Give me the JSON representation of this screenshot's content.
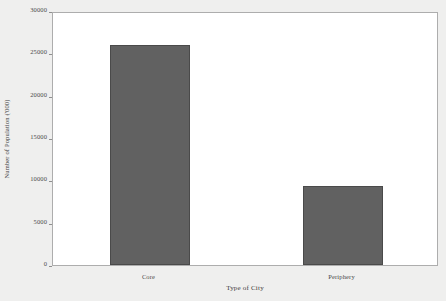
{
  "chart_data": {
    "type": "bar",
    "title": "",
    "categories": [
      "Core",
      "Periphery"
    ],
    "values": [
      26000,
      9300
    ],
    "xlabel": "Type of City",
    "ylabel": "Number of Population ('000)",
    "ylim": [
      0,
      30000
    ],
    "yticks": [
      0,
      5000,
      10000,
      15000,
      20000,
      25000,
      30000
    ],
    "ytick_labels": [
      "0",
      "5000",
      "10000",
      "15000",
      "20000",
      "25000",
      "30000"
    ],
    "grid": false,
    "legend": null,
    "series": [
      {
        "name": "Number of Population ('000)",
        "values": [
          26000,
          9300
        ]
      }
    ],
    "bar_color": "#616161",
    "plot_background": "#ffffff",
    "canvas_background": "#efefee",
    "axis_color": "#adadad"
  }
}
